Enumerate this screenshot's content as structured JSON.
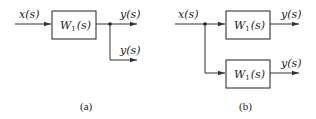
{
  "diagram_a": {
    "caption": "(a)",
    "input_label": "x(s)",
    "block_label": "W",
    "block_subscript": "1",
    "block_arg": "(s)",
    "output_labels": [
      "y(s)",
      "y(s)"
    ]
  },
  "diagram_b": {
    "caption": "(b)",
    "input_label": "x(s)",
    "blocks": [
      {
        "label": "W",
        "subscript": "1",
        "arg": "(s)"
      },
      {
        "label": "W",
        "subscript": "1",
        "arg": "(s)"
      }
    ],
    "output_labels": [
      "y(s)",
      "y(s)"
    ]
  },
  "colors": {
    "line": "#333333",
    "text": "#222222",
    "background": "#ffffff"
  }
}
